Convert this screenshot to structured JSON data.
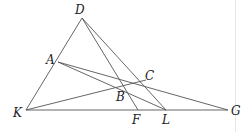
{
  "diagram": {
    "points": {
      "D": {
        "label": "D",
        "x": 82,
        "y": 18,
        "lx": 75,
        "ly": 14
      },
      "A": {
        "label": "A",
        "x": 58,
        "y": 62,
        "lx": 46,
        "ly": 64
      },
      "K": {
        "label": "K",
        "x": 26,
        "y": 110,
        "lx": 13,
        "ly": 117
      },
      "B": {
        "label": "B",
        "x": 124,
        "y": 88,
        "lx": 116,
        "ly": 101
      },
      "C": {
        "label": "C",
        "x": 146,
        "y": 80,
        "lx": 145,
        "ly": 80
      },
      "F": {
        "label": "F",
        "x": 138,
        "y": 110,
        "lx": 132,
        "ly": 124
      },
      "L": {
        "label": "L",
        "x": 166,
        "y": 110,
        "lx": 162,
        "ly": 124
      },
      "G": {
        "label": "G",
        "x": 228,
        "y": 110,
        "lx": 231,
        "ly": 115
      }
    },
    "segments": [
      [
        "D",
        "K"
      ],
      [
        "D",
        "F"
      ],
      [
        "D",
        "L"
      ],
      [
        "K",
        "G"
      ],
      [
        "K",
        "C"
      ],
      [
        "A",
        "G"
      ],
      [
        "A",
        "L"
      ]
    ]
  }
}
